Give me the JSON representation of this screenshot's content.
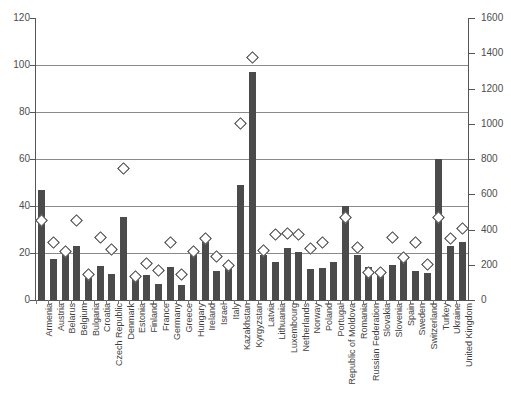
{
  "chart_data": {
    "type": "bar",
    "title": "",
    "subtitle": "",
    "xlabel": "",
    "ylabel": "",
    "ylabel_right": "",
    "grid": true,
    "legend_position": "none",
    "ylim": [
      0,
      120
    ],
    "yticks": [
      0,
      20,
      40,
      60,
      80,
      100,
      120
    ],
    "ylim_right": [
      0,
      1600
    ],
    "yticks_right": [
      0,
      200,
      400,
      600,
      800,
      1000,
      1200,
      1400,
      1600
    ],
    "categories": [
      "Armenia",
      "Austria",
      "Belarus",
      "Belgium",
      "Bulgaria",
      "Croatia",
      "Czech Republic",
      "Denmark",
      "Estonia",
      "Finland",
      "France",
      "Germany",
      "Greece",
      "Hungary",
      "Ireland",
      "Israel",
      "Italy",
      "Kazakhstan",
      "Kyrgyzstan",
      "Latvia",
      "Lithuania",
      "Luxembourg",
      "Netherlands",
      "Norway",
      "Poland",
      "Portugal",
      "Republic of Moldova",
      "Romania",
      "Russian Federation",
      "Slovakia",
      "Slovenia",
      "Spain",
      "Sweden",
      "Switzerland",
      "Turkey",
      "Ukraine",
      "United Kingdom"
    ],
    "series": [
      {
        "name": "bars",
        "axis": "left",
        "type": "bar",
        "values": [
          47,
          17.5,
          19.5,
          23,
          10.5,
          14.5,
          11,
          35.5,
          10,
          10.5,
          7,
          14,
          6.5,
          20.5,
          24.5,
          12.5,
          13,
          49,
          97,
          19,
          16,
          22,
          20.5,
          13,
          13.5,
          16,
          40,
          19,
          14,
          11.5,
          15,
          17,
          12.5,
          11.5,
          60,
          23,
          24.5
        ]
      },
      {
        "name": "markers",
        "axis": "left",
        "type": "scatter",
        "marker": "diamond",
        "values": [
          34,
          24.5,
          20.5,
          34,
          11,
          26.5,
          21.5,
          56,
          10,
          15.5,
          12.5,
          24.5,
          11,
          20.5,
          26,
          18.5,
          14.5,
          75,
          103,
          21,
          28,
          28.5,
          28,
          22,
          24.5,
          null,
          35,
          22.5,
          11.5,
          11.5,
          26.5,
          18,
          24.5,
          15,
          35,
          26,
          30.5
        ]
      }
    ]
  }
}
